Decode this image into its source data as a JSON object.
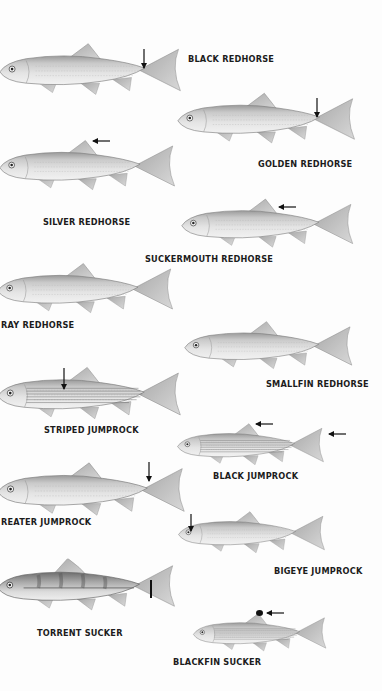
{
  "plate": {
    "background": "#fdfdfd",
    "species": [
      {
        "name": "BLACK REDHORSE",
        "mark": "caudal-peduncle arrow"
      },
      {
        "name": "GOLDEN REDHORSE",
        "mark": "caudal-peduncle arrow"
      },
      {
        "name": "SILVER REDHORSE",
        "mark": "dorsal-fin arrow"
      },
      {
        "name": "SUCKERMOUTH REDHORSE",
        "mark": "dorsal-fin arrow"
      },
      {
        "name": "GRAY REDHORSE",
        "visible_label": "RAY REDHORSE"
      },
      {
        "name": "SMALLFIN REDHORSE"
      },
      {
        "name": "STRIPED JUMPROCK",
        "mark": "body-stripe arrow"
      },
      {
        "name": "BLACK JUMPROCK",
        "mark": "dorsal and caudal tip arrows"
      },
      {
        "name": "GREATER JUMPROCK",
        "visible_label": "REATER JUMPROCK",
        "mark": "caudal-peduncle arrow"
      },
      {
        "name": "BIGEYE JUMPROCK",
        "mark": "eye arrow"
      },
      {
        "name": "TORRENT SUCKER",
        "mark": "caudal-peduncle bar"
      },
      {
        "name": "BLACKFIN SUCKER",
        "mark": "dorsal-fin tip arrow"
      }
    ]
  },
  "labels": {
    "black_redhorse": "BLACK REDHORSE",
    "golden_redhorse": "GOLDEN REDHORSE",
    "silver_redhorse": "SILVER REDHORSE",
    "suckermouth_redhorse": "SUCKERMOUTH REDHORSE",
    "gray_redhorse": "RAY REDHORSE",
    "smallfin_redhorse": "SMALLFIN REDHORSE",
    "striped_jumprock": "STRIPED JUMPROCK",
    "black_jumprock": "BLACK JUMPROCK",
    "greater_jumprock": "REATER JUMPROCK",
    "bigeye_jumprock": "BIGEYE JUMPROCK",
    "torrent_sucker": "TORRENT SUCKER",
    "blackfin_sucker": "BLACKFIN SUCKER"
  },
  "colors": {
    "body_light": "#e6e6e6",
    "body_mid": "#c4c4c4",
    "body_dark": "#8a8a8a",
    "fin": "#bdbdbd",
    "outline": "#7a7a7a",
    "arrow": "#111111",
    "text": "#1c1c1c"
  }
}
